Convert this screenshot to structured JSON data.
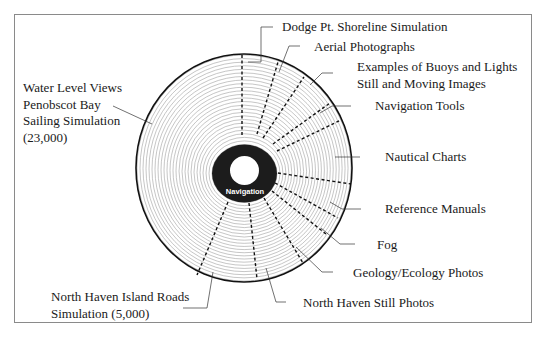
{
  "diagram": {
    "title": "",
    "center": {
      "label": "Navigation"
    },
    "colors": {
      "frame": "#8a8a8a",
      "rings": "#9a9a9a",
      "outline": "#111111",
      "hub": "#1c1c1c",
      "text": "#1a1a1a"
    },
    "labels": [
      {
        "id": "dodge",
        "lines": [
          "Dodge Pt. Shoreline Simulation"
        ]
      },
      {
        "id": "aerial",
        "lines": [
          "Aerial Photographs"
        ]
      },
      {
        "id": "buoys",
        "lines": [
          "Examples of Buoys and Lights",
          "Still and Moving Images"
        ]
      },
      {
        "id": "navtools",
        "lines": [
          "Navigation Tools"
        ]
      },
      {
        "id": "charts",
        "lines": [
          "Nautical Charts"
        ]
      },
      {
        "id": "manuals",
        "lines": [
          "Reference Manuals"
        ]
      },
      {
        "id": "fog",
        "lines": [
          "Fog"
        ]
      },
      {
        "id": "geology",
        "lines": [
          "Geology/Ecology Photos"
        ]
      },
      {
        "id": "nhstill",
        "lines": [
          "North Haven Still Photos"
        ]
      },
      {
        "id": "nhroads",
        "lines": [
          "North Haven Island Roads",
          "Simulation (5,000)"
        ]
      },
      {
        "id": "water",
        "lines": [
          "Water Level Views",
          "Penobscot Bay",
          "Sailing Simulation",
          "(23,000)"
        ]
      }
    ]
  }
}
